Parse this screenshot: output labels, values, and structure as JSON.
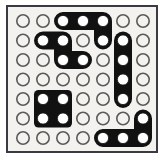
{
  "board": {
    "title": "perfboard-trace-layout",
    "description": "Monochrome 7x7 perforated prototyping board with black copper traces and pads",
    "rows": 7,
    "columns": 7,
    "colors": {
      "background": "#ffffff",
      "board_fill": "#f4f2ee",
      "border": "#3a3a42",
      "trace": "#111111",
      "hole_unfilled_stroke": "#5a5a5a",
      "hole_filled_fill": "#ffffff",
      "hole_filled_stroke": "#111111"
    },
    "geometry": {
      "frame_x": 6,
      "frame_y": 5,
      "frame_width": 152,
      "frame_height": 148,
      "frame_stroke_width": 2,
      "origin_x": 23,
      "origin_y": 21,
      "pitch_x": 20.0,
      "pitch_y": 19.5,
      "hole_radius": 6.2,
      "hole_stroke_width": 1.6,
      "trace_half_width": 9.0,
      "trace_corner_radius": 4.5,
      "pad_hole_radius": 5.6
    },
    "holes_unfilled_count": 30,
    "holes_filled_count": 19
  },
  "traces": [
    {
      "id": "trace-top-l",
      "name": "top-horizontal-elbow",
      "shape": "L",
      "path_cells": [
        [
          1,
          3
        ],
        [
          1,
          4
        ],
        [
          1,
          5
        ],
        [
          2,
          5
        ]
      ],
      "pads": [
        [
          1,
          3
        ],
        [
          1,
          4
        ],
        [
          1,
          5
        ],
        [
          2,
          5
        ]
      ]
    },
    {
      "id": "trace-upper-left-z",
      "name": "upper-left-zigzag",
      "shape": "Z",
      "path_cells": [
        [
          2,
          2
        ],
        [
          2,
          3
        ],
        [
          3,
          3
        ],
        [
          3,
          4
        ]
      ],
      "pads": [
        [
          2,
          2
        ],
        [
          2,
          3
        ],
        [
          3,
          3
        ],
        [
          3,
          4
        ]
      ]
    },
    {
      "id": "trace-right-vertical",
      "name": "right-vertical-bus",
      "shape": "I",
      "path_cells": [
        [
          2,
          6
        ],
        [
          3,
          6
        ],
        [
          4,
          6
        ],
        [
          5,
          6
        ]
      ],
      "pads": [
        [
          2,
          6
        ],
        [
          3,
          6
        ],
        [
          4,
          6
        ],
        [
          5,
          6
        ]
      ]
    },
    {
      "id": "pad-block-square",
      "name": "center-left-square-pad",
      "shape": "square",
      "path_cells": [
        [
          5,
          2
        ],
        [
          5,
          3
        ],
        [
          6,
          2
        ],
        [
          6,
          3
        ]
      ],
      "pads": [
        [
          5,
          2
        ],
        [
          5,
          3
        ],
        [
          6,
          2
        ],
        [
          6,
          3
        ]
      ]
    },
    {
      "id": "trace-bottom-right-l",
      "name": "bottom-right-elbow",
      "shape": "L",
      "path_cells": [
        [
          6,
          7
        ],
        [
          7,
          7
        ],
        [
          7,
          6
        ],
        [
          7,
          5
        ]
      ],
      "pads": [
        [
          6,
          7
        ],
        [
          7,
          5
        ],
        [
          7,
          6
        ],
        [
          7,
          7
        ]
      ]
    }
  ],
  "empty_holes": [
    [
      1,
      1
    ],
    [
      1,
      2
    ],
    [
      1,
      6
    ],
    [
      1,
      7
    ],
    [
      2,
      1
    ],
    [
      2,
      4
    ],
    [
      2,
      7
    ],
    [
      3,
      1
    ],
    [
      3,
      2
    ],
    [
      3,
      5
    ],
    [
      3,
      7
    ],
    [
      4,
      1
    ],
    [
      4,
      2
    ],
    [
      4,
      3
    ],
    [
      4,
      4
    ],
    [
      4,
      5
    ],
    [
      4,
      7
    ],
    [
      5,
      1
    ],
    [
      5,
      4
    ],
    [
      5,
      5
    ],
    [
      5,
      7
    ],
    [
      6,
      1
    ],
    [
      6,
      4
    ],
    [
      6,
      5
    ],
    [
      6,
      6
    ],
    [
      7,
      1
    ],
    [
      7,
      2
    ],
    [
      7,
      3
    ],
    [
      7,
      4
    ]
  ]
}
